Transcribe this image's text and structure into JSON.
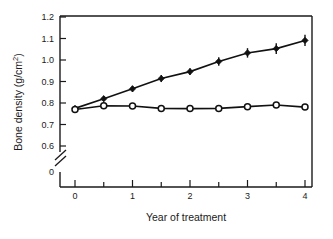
{
  "chart_data": {
    "type": "line",
    "title": "",
    "xlabel": "Year of treatment",
    "ylabel": "Bone density (g/cm2)",
    "ylabel_display": "Bone density (g/cm",
    "ylabel_sup": "2",
    "ylabel_tail": ")",
    "xlim": [
      0,
      4.25
    ],
    "ylim": [
      0.55,
      1.2
    ],
    "grid": false,
    "legend": "none",
    "axis_break": {
      "present": true,
      "between": [
        0,
        0.6
      ],
      "symbol": "double-slash"
    },
    "x": [
      0,
      0.5,
      1,
      1.5,
      2,
      2.5,
      3,
      3.5,
      4
    ],
    "xticks": [
      0,
      1,
      2,
      3,
      4
    ],
    "xticklabels": [
      "0",
      "1",
      "2",
      "3",
      "4"
    ],
    "xminorticks": [
      0.5,
      1.5,
      2.5,
      3.5
    ],
    "yticks": [
      0.6,
      0.7,
      0.8,
      0.9,
      1.0,
      1.1,
      1.2
    ],
    "yticklabels": [
      "0.6",
      "0.7",
      "0.8",
      "0.9",
      "1.0",
      "1.1",
      "1.2"
    ],
    "yzero_label": "0",
    "series": [
      {
        "name": "treatment",
        "marker": "filled-diamond",
        "values": [
          0.775,
          0.82,
          0.866,
          0.914,
          0.946,
          0.993,
          1.033,
          1.053,
          1.091
        ],
        "errors": [
          0.008,
          0.012,
          0.014,
          0.016,
          0.016,
          0.02,
          0.022,
          0.025,
          0.026
        ]
      },
      {
        "name": "control",
        "marker": "open-circle",
        "values": [
          0.77,
          0.787,
          0.786,
          0.775,
          0.774,
          0.775,
          0.783,
          0.791,
          0.781
        ],
        "errors": [
          0.006,
          0.006,
          0.006,
          0.006,
          0.006,
          0.006,
          0.006,
          0.007,
          0.006
        ]
      }
    ]
  }
}
